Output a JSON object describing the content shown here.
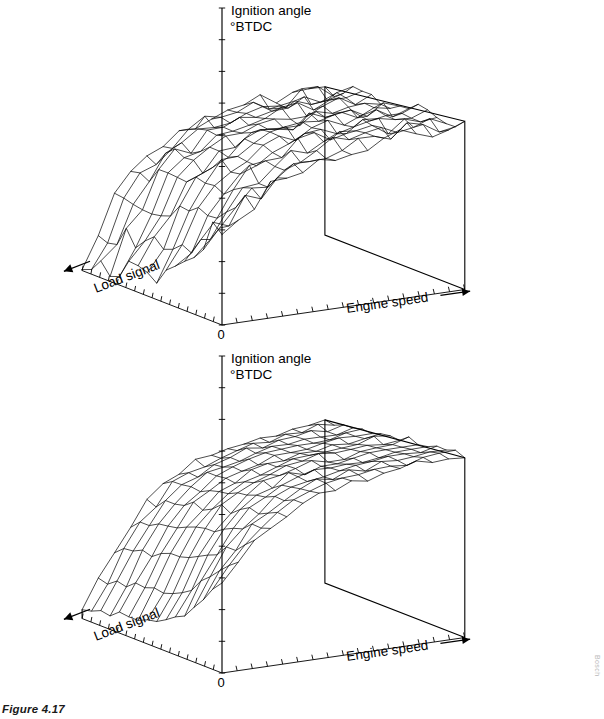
{
  "figure": {
    "caption": "Figure 4.17",
    "credit": "Bosch"
  },
  "plots": [
    {
      "id": "top",
      "z_axis_label_line1": "Ignition angle",
      "z_axis_label_line2": "°BTDC",
      "x_axis_label": "Engine speed",
      "y_axis_label": "Load signal",
      "origin_label": "0"
    },
    {
      "id": "bottom",
      "z_axis_label_line1": "Ignition angle",
      "z_axis_label_line2": "°BTDC",
      "x_axis_label": "Engine speed",
      "y_axis_label": "Load signal",
      "origin_label": "0"
    }
  ],
  "chart_data": [
    {
      "type": "surface",
      "title": "Ignition angle map (electronically mapped, irregular)",
      "xlabel": "Engine speed",
      "ylabel": "Load signal",
      "zlabel": "Ignition angle °BTDC",
      "x": [
        0,
        1,
        2,
        3,
        4,
        5,
        6,
        7,
        8,
        9,
        10,
        11,
        12,
        13,
        14,
        15
      ],
      "y": [
        0,
        1,
        2,
        3,
        4,
        5,
        6,
        7,
        8,
        9,
        10,
        11,
        12,
        13,
        14,
        15
      ],
      "grid": false,
      "legend": "none",
      "axis_ticks": {
        "x_count": 16,
        "y_count": 16,
        "z_count": 10
      },
      "z": [
        [
          22,
          24,
          26,
          28,
          30,
          31,
          32,
          33,
          34,
          35,
          35,
          36,
          36,
          36,
          36,
          36
        ],
        [
          20,
          22,
          25,
          27,
          29,
          31,
          32,
          33,
          34,
          35,
          35,
          36,
          36,
          36,
          36,
          36
        ],
        [
          16,
          19,
          23,
          26,
          28,
          30,
          32,
          33,
          34,
          35,
          35,
          35,
          36,
          36,
          36,
          36
        ],
        [
          12,
          17,
          22,
          25,
          28,
          30,
          32,
          33,
          34,
          34,
          35,
          35,
          35,
          36,
          36,
          36
        ],
        [
          9,
          15,
          21,
          25,
          28,
          30,
          31,
          33,
          34,
          34,
          35,
          35,
          35,
          35,
          36,
          36
        ],
        [
          7,
          13,
          20,
          24,
          27,
          30,
          31,
          32,
          33,
          34,
          34,
          35,
          35,
          35,
          35,
          36
        ],
        [
          6,
          12,
          19,
          24,
          27,
          29,
          31,
          32,
          33,
          34,
          34,
          34,
          35,
          35,
          35,
          35
        ],
        [
          5,
          11,
          18,
          23,
          27,
          29,
          31,
          32,
          33,
          33,
          34,
          34,
          34,
          35,
          35,
          35
        ],
        [
          5,
          11,
          18,
          23,
          26,
          29,
          30,
          32,
          33,
          33,
          34,
          34,
          34,
          34,
          35,
          35
        ],
        [
          4,
          10,
          17,
          22,
          26,
          28,
          30,
          31,
          32,
          33,
          33,
          34,
          34,
          34,
          34,
          35
        ],
        [
          4,
          10,
          17,
          22,
          26,
          28,
          30,
          31,
          32,
          33,
          33,
          33,
          34,
          34,
          34,
          34
        ],
        [
          3,
          9,
          16,
          21,
          25,
          28,
          29,
          31,
          32,
          32,
          33,
          33,
          33,
          34,
          34,
          34
        ],
        [
          3,
          9,
          16,
          21,
          25,
          27,
          29,
          30,
          31,
          32,
          32,
          33,
          33,
          33,
          34,
          34
        ],
        [
          2,
          8,
          15,
          20,
          24,
          27,
          29,
          30,
          31,
          32,
          32,
          32,
          33,
          33,
          33,
          34
        ],
        [
          2,
          8,
          15,
          20,
          24,
          26,
          28,
          30,
          31,
          31,
          32,
          32,
          32,
          33,
          33,
          33
        ],
        [
          1,
          7,
          14,
          19,
          23,
          26,
          28,
          29,
          30,
          31,
          31,
          32,
          32,
          32,
          33,
          33
        ]
      ],
      "roughness": 0.55,
      "description": "Ignition map with pronounced ripples/irregularity across the whole surface; advance increases with engine speed and decreases toward high load."
    },
    {
      "type": "surface",
      "title": "Ignition angle map (smoothed / optimised)",
      "xlabel": "Engine speed",
      "ylabel": "Load signal",
      "zlabel": "Ignition angle °BTDC",
      "x": [
        0,
        1,
        2,
        3,
        4,
        5,
        6,
        7,
        8,
        9,
        10,
        11,
        12,
        13,
        14,
        15
      ],
      "y": [
        0,
        1,
        2,
        3,
        4,
        5,
        6,
        7,
        8,
        9,
        10,
        11,
        12,
        13,
        14,
        15
      ],
      "grid": false,
      "legend": "none",
      "axis_ticks": {
        "x_count": 16,
        "y_count": 16,
        "z_count": 10
      },
      "z": [
        [
          20,
          24,
          28,
          31,
          33,
          35,
          36,
          37,
          38,
          38,
          39,
          39,
          40,
          40,
          40,
          40
        ],
        [
          18,
          22,
          27,
          30,
          33,
          35,
          36,
          37,
          38,
          38,
          39,
          39,
          39,
          40,
          40,
          40
        ],
        [
          15,
          20,
          25,
          29,
          32,
          34,
          36,
          37,
          37,
          38,
          38,
          39,
          39,
          39,
          40,
          40
        ],
        [
          12,
          18,
          24,
          28,
          31,
          34,
          35,
          36,
          37,
          38,
          38,
          38,
          39,
          39,
          39,
          40
        ],
        [
          10,
          16,
          22,
          27,
          31,
          33,
          35,
          36,
          37,
          37,
          38,
          38,
          38,
          39,
          39,
          39
        ],
        [
          8,
          14,
          21,
          26,
          30,
          33,
          34,
          36,
          36,
          37,
          37,
          38,
          38,
          38,
          39,
          39
        ],
        [
          7,
          13,
          20,
          25,
          29,
          32,
          34,
          35,
          36,
          37,
          37,
          37,
          38,
          38,
          38,
          39
        ],
        [
          6,
          12,
          19,
          25,
          29,
          32,
          33,
          35,
          36,
          36,
          37,
          37,
          37,
          38,
          38,
          38
        ],
        [
          5,
          11,
          18,
          24,
          28,
          31,
          33,
          34,
          35,
          36,
          36,
          37,
          37,
          37,
          38,
          38
        ],
        [
          5,
          11,
          18,
          23,
          27,
          30,
          32,
          34,
          35,
          35,
          36,
          36,
          37,
          37,
          37,
          38
        ],
        [
          4,
          10,
          17,
          23,
          27,
          30,
          32,
          33,
          34,
          35,
          35,
          36,
          36,
          37,
          37,
          37
        ],
        [
          4,
          10,
          16,
          22,
          26,
          29,
          31,
          33,
          34,
          35,
          35,
          36,
          36,
          36,
          37,
          37
        ],
        [
          3,
          9,
          16,
          21,
          26,
          29,
          31,
          32,
          33,
          34,
          35,
          35,
          36,
          36,
          36,
          37
        ],
        [
          3,
          9,
          15,
          21,
          25,
          28,
          30,
          32,
          33,
          34,
          34,
          35,
          35,
          36,
          36,
          36
        ],
        [
          2,
          8,
          15,
          20,
          24,
          28,
          30,
          31,
          32,
          33,
          34,
          34,
          35,
          35,
          36,
          36
        ],
        [
          2,
          8,
          14,
          19,
          24,
          27,
          29,
          31,
          32,
          33,
          33,
          34,
          34,
          35,
          35,
          36
        ]
      ],
      "roughness": 0.18,
      "description": "Smoother ignition map: a steep flank at low engine speed rising to a broad plateau; far fewer ripples than the upper map."
    }
  ]
}
